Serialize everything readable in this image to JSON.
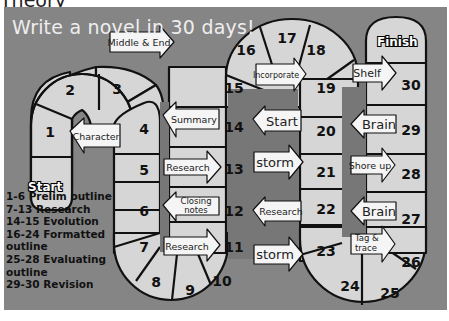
{
  "header": {
    "partial_text": "Theory"
  },
  "board": {
    "title": "Write a novel in 30 days!",
    "start_label": "Start",
    "finish_label": "Finish",
    "background_color": "#858585",
    "cell_color": "#d6d6d6",
    "arrow_color": "#f5f5f5",
    "cells": [
      "1",
      "2",
      "3",
      "4",
      "5",
      "6",
      "7",
      "8",
      "9",
      "10",
      "11",
      "12",
      "13",
      "14",
      "15",
      "16",
      "17",
      "18",
      "19",
      "20",
      "21",
      "22",
      "23",
      "24",
      "25",
      "26",
      "27",
      "28",
      "29",
      "30"
    ],
    "arrows": [
      {
        "label": "Character",
        "direction": "left"
      },
      {
        "label": "Middle & End",
        "direction": "right"
      },
      {
        "label": "Summary",
        "direction": "left"
      },
      {
        "label": "Research",
        "direction": "right",
        "row": 5
      },
      {
        "label": "Closing notes",
        "line1": "Closing",
        "line2": "notes",
        "direction": "left"
      },
      {
        "label": "Research",
        "direction": "right",
        "row": 7
      },
      {
        "label": "Incorporate",
        "direction": "right"
      },
      {
        "label": "Start",
        "direction": "left"
      },
      {
        "label": "storm",
        "direction": "right",
        "row": 13
      },
      {
        "label": "Research",
        "direction": "left",
        "row": 12
      },
      {
        "label": "storm",
        "direction": "right",
        "row": 11
      },
      {
        "label": "Shelf",
        "direction": "right"
      },
      {
        "label": "Brain",
        "direction": "left",
        "row": 29
      },
      {
        "label": "Shore up",
        "direction": "right"
      },
      {
        "label": "Brain",
        "direction": "left",
        "row": 27
      },
      {
        "label": "Tag & trace",
        "line1": "Tag &",
        "line2": "trace",
        "direction": "right"
      }
    ]
  },
  "legend": [
    "1-6 Prelim outline",
    "7-13 Research",
    "14-15 Evolution",
    "16-24 Formatted",
    "outline",
    "25-28 Evaluating",
    "outline",
    "29-30 Revision"
  ]
}
